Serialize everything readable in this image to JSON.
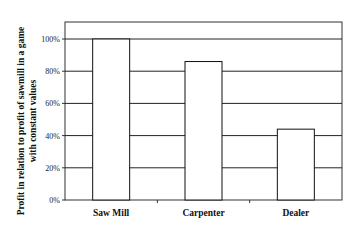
{
  "chart_data": {
    "type": "bar",
    "title": "",
    "xlabel": "",
    "ylabel": "Profit in relation to profit of sawmill in a  game with constant values",
    "ylabel_lines": [
      "Profit in relation to profit of sawmill in a  game",
      "with constant values"
    ],
    "categories": [
      "Saw Mill",
      "Carpenter",
      "Dealer"
    ],
    "values": [
      100,
      86,
      44
    ],
    "ylim": [
      0,
      110
    ],
    "yticks": [
      0,
      20,
      40,
      60,
      80,
      100
    ],
    "ytick_labels": [
      "0%",
      "20%",
      "40%",
      "60%",
      "80%",
      "100%"
    ],
    "grid": true,
    "legend": "none",
    "colors": {
      "bar_fill": "#ffffff",
      "bar_stroke": "#111111",
      "grid": "#222222"
    }
  }
}
